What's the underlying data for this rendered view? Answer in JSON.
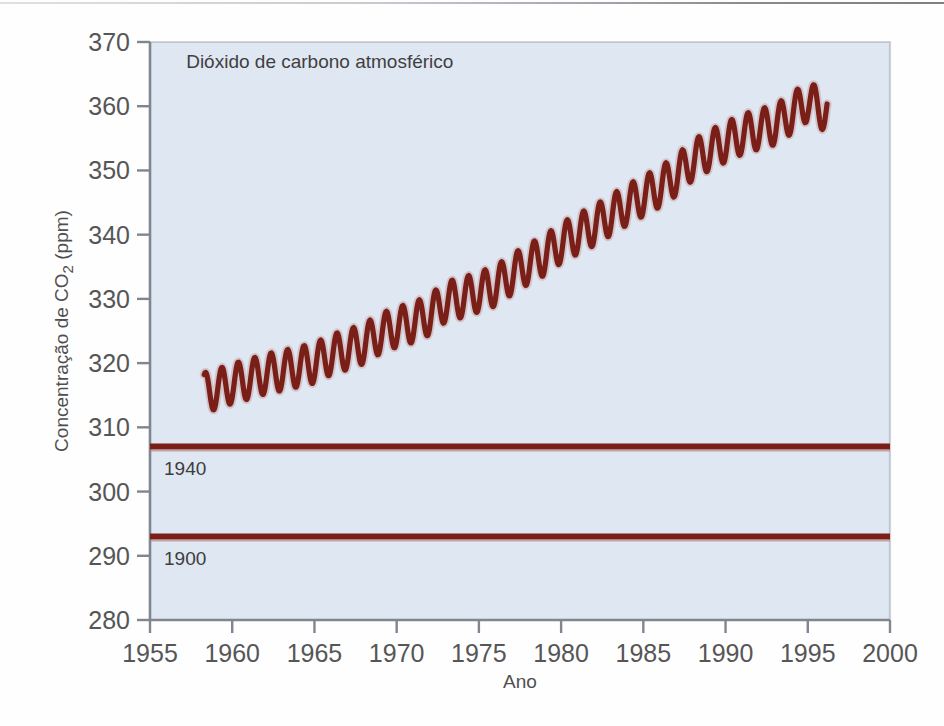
{
  "chart_data": {
    "type": "line",
    "title": "Dióxido de carbono atmosférico",
    "xlabel": "Ano",
    "ylabel_parts": {
      "pre": "Concentração de CO",
      "sub": "2",
      "post": " (ppm)"
    },
    "ylabel": "Concentração de CO2 (ppm)",
    "xlim": [
      1955,
      2000
    ],
    "ylim": [
      280,
      370
    ],
    "xticks": [
      1955,
      1960,
      1965,
      1970,
      1975,
      1980,
      1985,
      1990,
      1995,
      2000
    ],
    "yticks": [
      280,
      290,
      300,
      310,
      320,
      330,
      340,
      350,
      360,
      370
    ],
    "grid": false,
    "legend": "none",
    "accent_color": "#7a1f18",
    "plot_background": "#dfe7f3",
    "axis_color": "#808690",
    "series": [
      {
        "name": "Mauna Loa CO2 (média anual com ciclo sazonal)",
        "style": "sawtooth-oscillation-on-rising-trend",
        "x_start": 1958.3,
        "x_end": 1996.2,
        "seasonal_amplitude_ppm": 3.1,
        "annual_means": [
          {
            "year": 1958,
            "value": 315.2
          },
          {
            "year": 1959,
            "value": 315.9
          },
          {
            "year": 1960,
            "value": 316.8
          },
          {
            "year": 1961,
            "value": 317.5
          },
          {
            "year": 1962,
            "value": 318.3
          },
          {
            "year": 1963,
            "value": 318.8
          },
          {
            "year": 1964,
            "value": 319.4
          },
          {
            "year": 1965,
            "value": 320.0
          },
          {
            "year": 1966,
            "value": 321.3
          },
          {
            "year": 1967,
            "value": 322.1
          },
          {
            "year": 1968,
            "value": 323.0
          },
          {
            "year": 1969,
            "value": 324.6
          },
          {
            "year": 1970,
            "value": 325.6
          },
          {
            "year": 1971,
            "value": 326.3
          },
          {
            "year": 1972,
            "value": 327.5
          },
          {
            "year": 1973,
            "value": 329.6
          },
          {
            "year": 1974,
            "value": 330.2
          },
          {
            "year": 1975,
            "value": 331.1
          },
          {
            "year": 1976,
            "value": 332.0
          },
          {
            "year": 1977,
            "value": 333.8
          },
          {
            "year": 1978,
            "value": 335.4
          },
          {
            "year": 1979,
            "value": 336.8
          },
          {
            "year": 1980,
            "value": 338.7
          },
          {
            "year": 1981,
            "value": 340.1
          },
          {
            "year": 1982,
            "value": 341.4
          },
          {
            "year": 1983,
            "value": 343.0
          },
          {
            "year": 1984,
            "value": 344.6
          },
          {
            "year": 1985,
            "value": 346.0
          },
          {
            "year": 1986,
            "value": 347.4
          },
          {
            "year": 1987,
            "value": 349.2
          },
          {
            "year": 1988,
            "value": 351.6
          },
          {
            "year": 1989,
            "value": 353.1
          },
          {
            "year": 1990,
            "value": 354.4
          },
          {
            "year": 1991,
            "value": 355.6
          },
          {
            "year": 1992,
            "value": 356.4
          },
          {
            "year": 1993,
            "value": 357.1
          },
          {
            "year": 1994,
            "value": 358.8
          },
          {
            "year": 1995,
            "value": 360.8
          },
          {
            "year": 1996,
            "value": 359.3
          }
        ]
      }
    ],
    "reference_lines": [
      {
        "label": "1940",
        "value": 307.0,
        "color": "#7a1f18"
      },
      {
        "label": "1900",
        "value": 293.0,
        "color": "#7a1f18"
      }
    ],
    "annotations": [
      {
        "text": "Dióxido de carbono atmosférico",
        "x": 1957.2,
        "y": 366.0
      }
    ]
  }
}
